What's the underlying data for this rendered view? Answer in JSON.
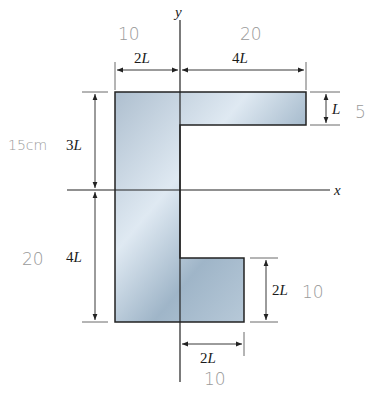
{
  "diagram": {
    "axes": {
      "x_label": "x",
      "y_label": "y"
    },
    "dimensions": {
      "top_left_width": {
        "coef": "2",
        "unit": "L"
      },
      "top_right_width": {
        "coef": "4",
        "unit": "L"
      },
      "top_flange_thickness": {
        "coef": "",
        "unit": "L"
      },
      "upper_height": {
        "coef": "3",
        "unit": "L"
      },
      "lower_height": {
        "coef": "4",
        "unit": "L"
      },
      "bottom_flange_height": {
        "coef": "2",
        "unit": "L"
      },
      "bottom_flange_width": {
        "coef": "2",
        "unit": "L"
      }
    },
    "handwritten_annotations": {
      "top_left_width": "10",
      "top_right_width": "20",
      "top_flange_thickness": "5",
      "upper_height": "15cm",
      "lower_height": "20",
      "bottom_flange_height": "10",
      "bottom_flange_width": "10"
    },
    "colors": {
      "shape_fill_light": "#dfe9f2",
      "shape_fill_dark": "#8aa4ba",
      "outline": "#222222",
      "handwriting": "#9a9a9a"
    }
  }
}
